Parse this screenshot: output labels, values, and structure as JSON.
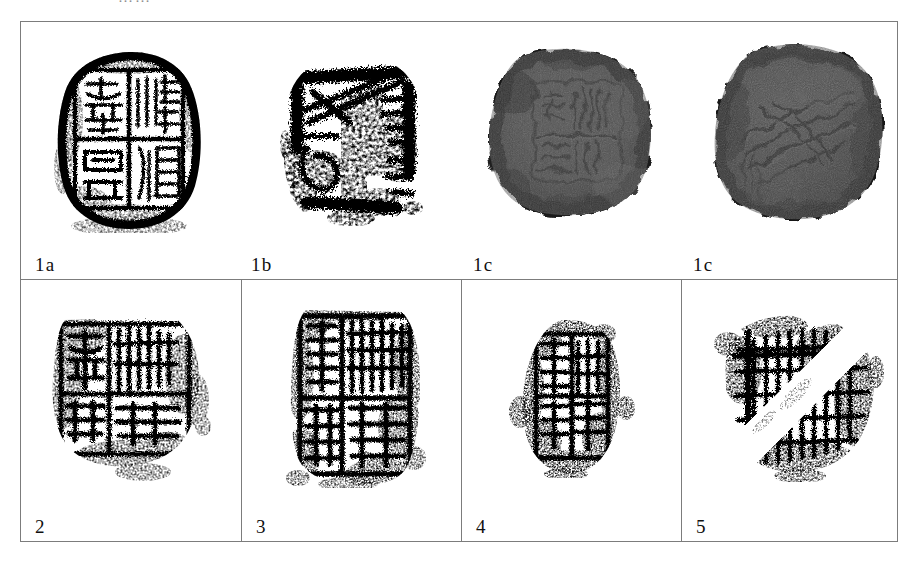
{
  "figure": {
    "type": "plate",
    "top_ghost_text": "……",
    "bottom_ghost_text": "",
    "border_color": "#7c7c7c",
    "background_color": "#ffffff",
    "rows": [
      {
        "row_id": "row-top",
        "divided": false,
        "cells": [
          {
            "label": "1a",
            "label_x": 14,
            "media": "seal-impression-rubbing",
            "caption_note": "round seal impression, cross-divided field, four characters"
          },
          {
            "label": "1b",
            "label_x": 230,
            "media": "seal-impression-rubbing",
            "caption_note": "high-contrast rubbing of the same seal"
          },
          {
            "label": "1c",
            "label_x": 452,
            "media": "clay-sealing-photograph",
            "caption_note": "grey clay bulla, obverse"
          },
          {
            "label": "1c",
            "label_x": 672,
            "media": "clay-sealing-photograph",
            "caption_note": "grey clay bulla, reverse"
          }
        ]
      },
      {
        "row_id": "row-bottom",
        "divided": true,
        "cells": [
          {
            "label": "2",
            "label_x": 14,
            "media": "seal-impression-rubbing",
            "caption_note": "irregular square impression with grid and characters"
          },
          {
            "label": "3",
            "label_x": 14,
            "media": "seal-impression-rubbing",
            "caption_note": "tall square impression, vertical column of characters"
          },
          {
            "label": "4",
            "label_x": 14,
            "media": "seal-impression-rubbing",
            "caption_note": "small fragmentary impression"
          },
          {
            "label": "5",
            "label_x": 14,
            "media": "seal-impression-rubbing",
            "caption_note": "fragmentary impression with diagonal blank band"
          }
        ]
      }
    ],
    "colors": {
      "ink": "#151515",
      "clay_light": "#8a8a8a",
      "clay_mid": "#5e5e5e",
      "clay_dark": "#3a3a3a",
      "paper": "#ffffff",
      "rule": "#7c7c7c"
    }
  }
}
